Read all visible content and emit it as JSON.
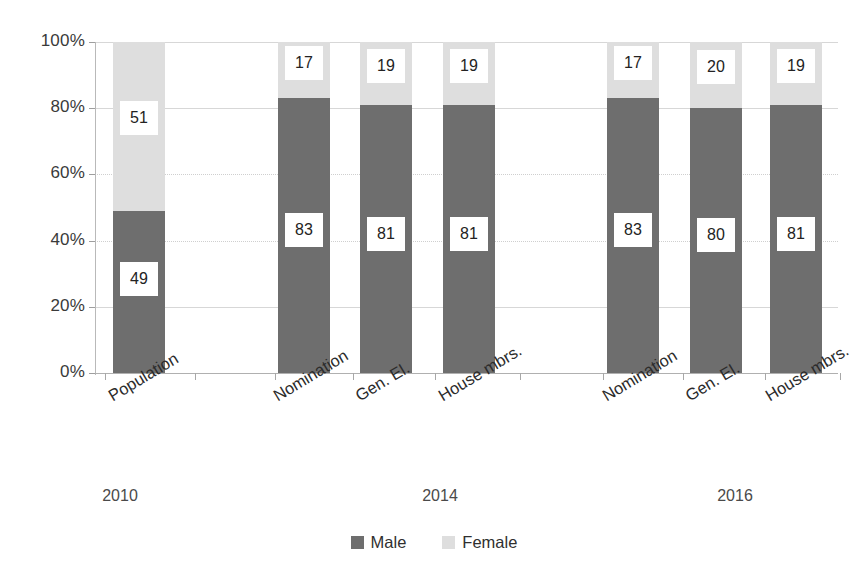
{
  "chart_data": {
    "type": "bar",
    "subtype": "stacked-100-percent",
    "title": "",
    "subtitle": "",
    "xlabel": "",
    "ylabel": "",
    "ylim": [
      0,
      100
    ],
    "ytick_labels": [
      "0%",
      "20%",
      "40%",
      "60%",
      "80%",
      "100%"
    ],
    "ytick_values": [
      0,
      20,
      40,
      60,
      80,
      100
    ],
    "grid": true,
    "grid_axis": "y",
    "legend_position": "bottom-center",
    "categories": [
      "Population",
      "Nomination",
      "Gen. El.",
      "House mbrs.",
      "Nomination",
      "Gen. El.",
      "House mbrs."
    ],
    "groups": [
      {
        "label": "2010",
        "category_indices": [
          0
        ]
      },
      {
        "label": "2014",
        "category_indices": [
          1,
          2,
          3
        ]
      },
      {
        "label": "2016",
        "category_indices": [
          4,
          5,
          6
        ]
      }
    ],
    "series": [
      {
        "name": "Male",
        "color": "#6e6e6e",
        "values": [
          49,
          83,
          81,
          81,
          83,
          80,
          81
        ]
      },
      {
        "name": "Female",
        "color": "#dedede",
        "values": [
          51,
          17,
          19,
          19,
          17,
          20,
          19
        ]
      }
    ],
    "data_labels": {
      "Male": [
        "49",
        "83",
        "81",
        "81",
        "83",
        "80",
        "81"
      ],
      "Female": [
        "51",
        "17",
        "19",
        "19",
        "17",
        "20",
        "19"
      ]
    }
  },
  "legend": {
    "items": [
      {
        "label": "Male",
        "color": "#6e6e6e"
      },
      {
        "label": "Female",
        "color": "#dedede"
      }
    ]
  },
  "colors": {
    "male": "#6e6e6e",
    "female": "#dedede",
    "gridline": "#d7d7d7",
    "axis": "#b0b0b0",
    "text": "#2b2b2b",
    "label_box_bg": "#ffffff"
  }
}
